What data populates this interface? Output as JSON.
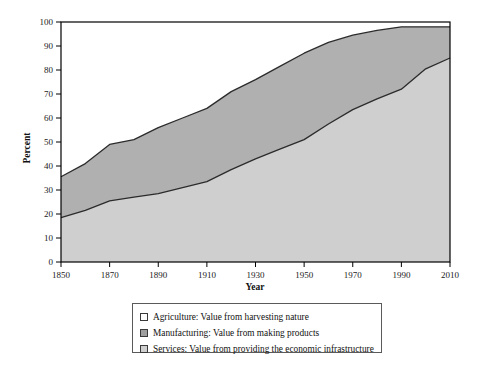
{
  "chart_data": {
    "type": "area",
    "title": "",
    "xlabel": "Year",
    "ylabel": "Percent",
    "xlim": [
      1850,
      2010
    ],
    "ylim": [
      0,
      100
    ],
    "grid": false,
    "stacked": true,
    "legend_position": "bottom",
    "x": [
      1850,
      1860,
      1870,
      1880,
      1890,
      1900,
      1910,
      1920,
      1930,
      1940,
      1950,
      1960,
      1970,
      1980,
      1990,
      2000,
      2010
    ],
    "xticks": [
      "1850",
      "1870",
      "1890",
      "1910",
      "1930",
      "1950",
      "1970",
      "1990",
      "2010"
    ],
    "xtick_values": [
      1850,
      1870,
      1890,
      1910,
      1930,
      1950,
      1970,
      1990,
      2010
    ],
    "yticks": [
      "0",
      "10",
      "20",
      "30",
      "40",
      "50",
      "60",
      "70",
      "80",
      "90",
      "100"
    ],
    "ytick_values": [
      0,
      10,
      20,
      30,
      40,
      50,
      60,
      70,
      80,
      90,
      100
    ],
    "series": [
      {
        "name": "Services: Value from providing the economic infrastructure",
        "short_name": "Services",
        "color": "#cfcfcf",
        "band_top_values": [
          18.5,
          21.5,
          25.5,
          27.0,
          28.5,
          31.0,
          33.5,
          38.5,
          43.0,
          47.0,
          51.0,
          57.5,
          63.5,
          68.0,
          72.0,
          80.5,
          85.0
        ]
      },
      {
        "name": "Manufacturing: Value from making products",
        "short_name": "Manufacturing",
        "color": "#b0b0b0",
        "band_top_values": [
          35.5,
          41.0,
          49.0,
          51.0,
          56.0,
          60.0,
          64.0,
          71.0,
          76.0,
          81.5,
          87.0,
          91.5,
          94.5,
          96.5,
          98.0,
          98.0,
          98.0
        ]
      },
      {
        "name": "Agriculture: Value from harvesting nature",
        "short_name": "Agriculture",
        "color": "#ffffff",
        "band_top_values": [
          100,
          100,
          100,
          100,
          100,
          100,
          100,
          100,
          100,
          100,
          100,
          100,
          100,
          100,
          100,
          100,
          100
        ]
      }
    ]
  },
  "legend": {
    "items": [
      {
        "swatch": "#ffffff",
        "label": "Agriculture: Value from harvesting nature"
      },
      {
        "swatch": "#9f9f9f",
        "label": "Manufacturing: Value from making products"
      },
      {
        "swatch": "#cfcfcf",
        "label": "Services: Value from providing the economic infrastructure"
      }
    ]
  },
  "colors": {
    "axis": "#000000",
    "line": "#2b2b2b",
    "services_fill": "#cfcfcf",
    "manufacturing_fill": "#b0b0b0",
    "agriculture_fill": "#ffffff",
    "background": "#ffffff"
  }
}
